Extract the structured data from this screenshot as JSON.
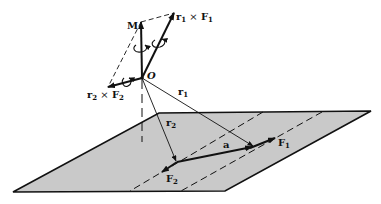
{
  "figure": {
    "colors": {
      "plane_fill": "#c9c9c9",
      "line": "#111111",
      "background": "#ffffff"
    }
  },
  "labels": {
    "M": "M",
    "O": "O",
    "r1": "r",
    "r1_sub": "1",
    "r2": "r",
    "r2_sub": "2",
    "F1": "F",
    "F1_sub": "1",
    "F2": "F",
    "F2_sub": "2",
    "a": "a",
    "r1xF1": {
      "r": "r",
      "r_sub": "1",
      "op": " × ",
      "F": "F",
      "F_sub": "1"
    },
    "r2xF2": {
      "r": "r",
      "r_sub": "2",
      "op": " × ",
      "F": "F",
      "F_sub": "2"
    }
  },
  "geometry": {
    "origin_O": [
      142,
      78
    ],
    "M_tip": [
      141,
      22
    ],
    "r1xF1_tip": [
      174,
      13
    ],
    "r2xF2_tip": [
      108,
      87
    ],
    "plane_corners": [
      [
        159,
        113
      ],
      [
        371,
        111
      ],
      [
        225,
        191
      ],
      [
        13,
        192
      ]
    ],
    "F1_base": [
      255,
      146
    ],
    "F1_tip": [
      275,
      138
    ],
    "F2_base": [
      177,
      162
    ],
    "F2_tip": [
      162,
      172
    ]
  }
}
